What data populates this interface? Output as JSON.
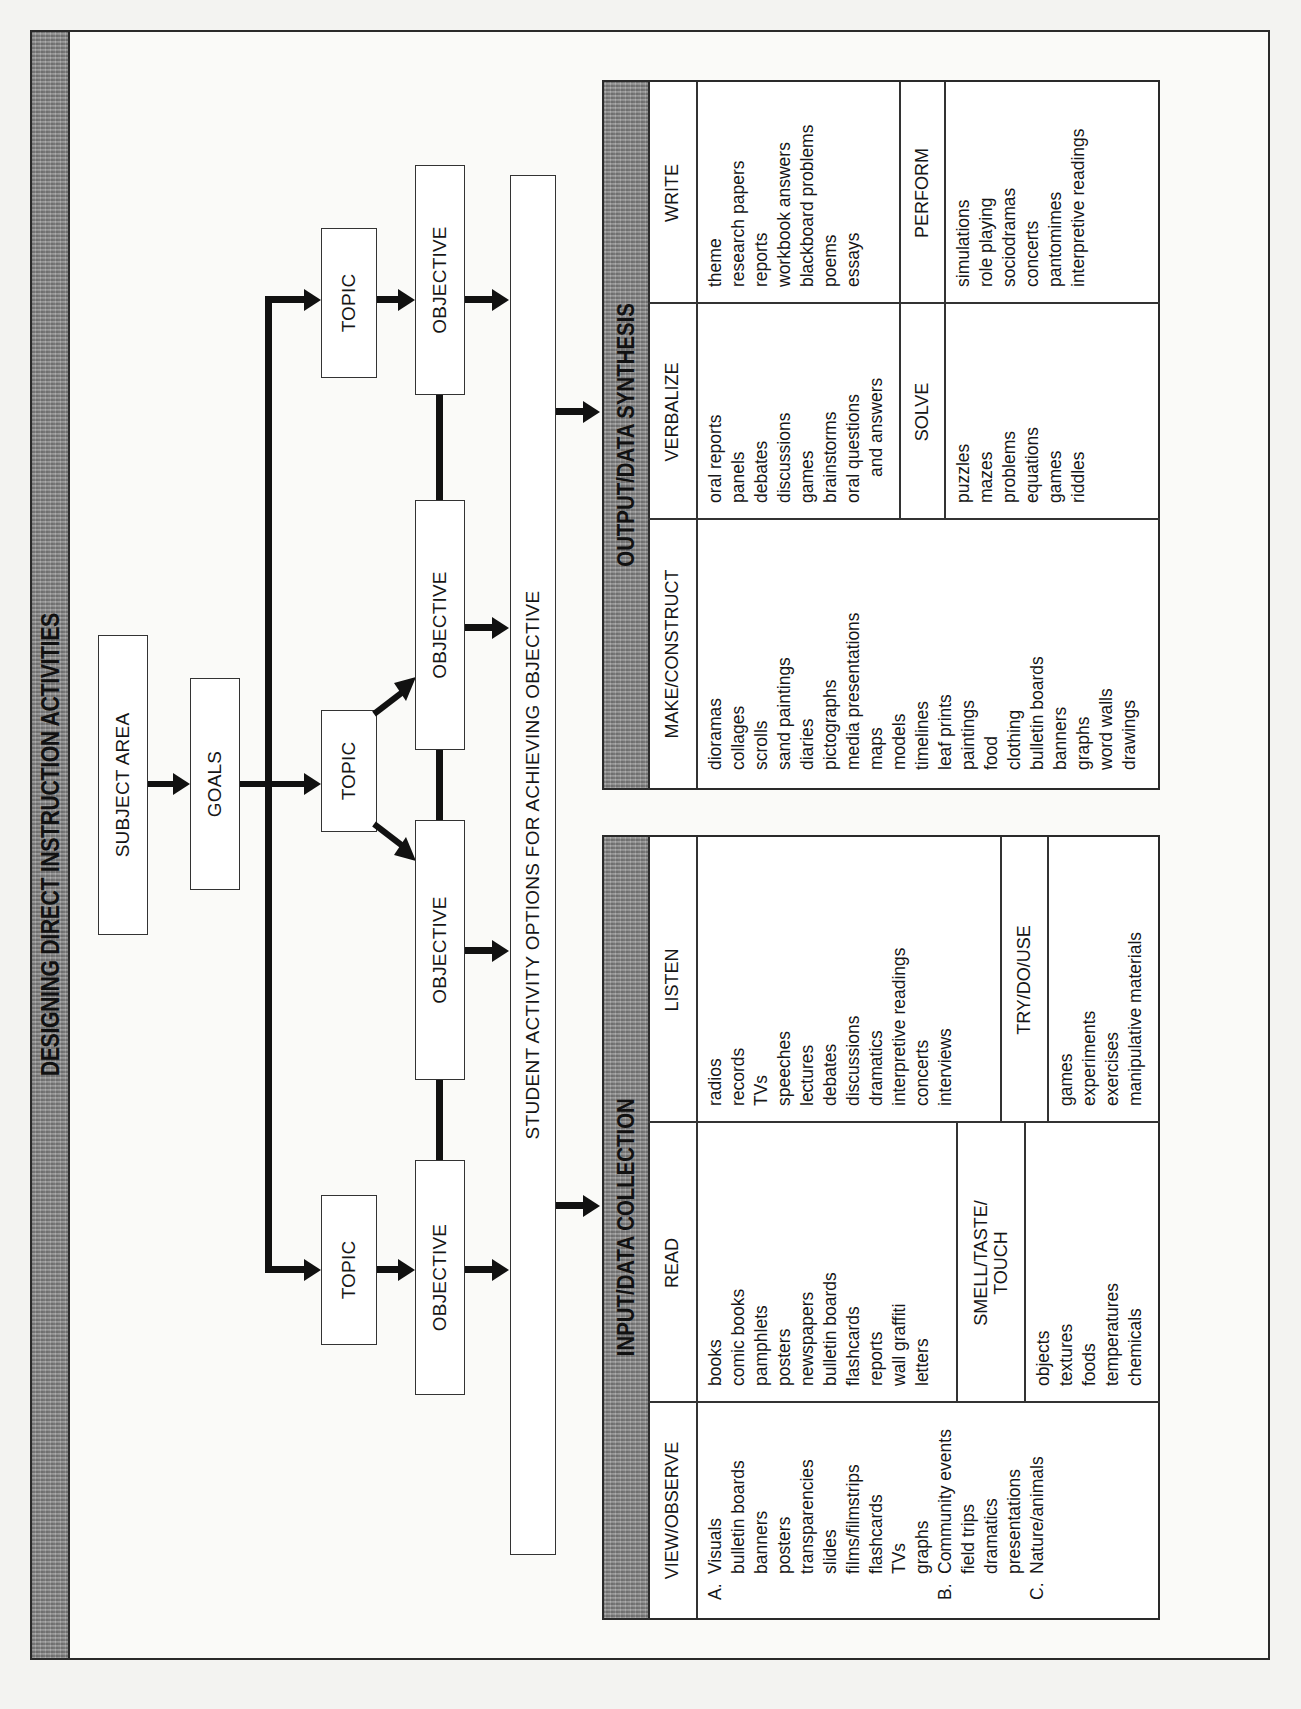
{
  "title": "DESIGNING DIRECT INSTRUCTION ACTIVITIES",
  "flowchart": {
    "subject_area": "SUBJECT AREA",
    "goals": "GOALS",
    "topics": [
      "TOPIC",
      "TOPIC",
      "TOPIC"
    ],
    "objectives": [
      "OBJECTIVE",
      "OBJECTIVE",
      "OBJECTIVE",
      "OBJECTIVE"
    ],
    "activity_bar": "STUDENT ACTIVITY OPTIONS FOR ACHIEVING OBJECTIVE"
  },
  "input_table": {
    "title": "INPUT/DATA COLLECTION",
    "view_observe": {
      "heading": "VIEW/OBSERVE",
      "groups": [
        {
          "marker": "A.",
          "label": "Visuals",
          "items": [
            "bulletin boards",
            "banners",
            "posters",
            "transparencies",
            "slides",
            "films/filmstrips",
            "flashcards",
            "TVs",
            "graphs"
          ]
        },
        {
          "marker": "B.",
          "label": "Community events",
          "items": [
            "field trips",
            "dramatics",
            "presentations"
          ]
        },
        {
          "marker": "C.",
          "label": "Nature/animals",
          "items": []
        }
      ]
    },
    "read": {
      "heading": "READ",
      "items": [
        "books",
        "comic books",
        "pamphlets",
        "posters",
        "newspapers",
        "bulletin boards",
        "flashcards",
        "reports",
        "wall graffiti",
        "letters"
      ]
    },
    "smell_taste_touch": {
      "heading_line1": "SMELL/TASTE/",
      "heading_line2": "TOUCH",
      "items": [
        "objects",
        "textures",
        "foods",
        "temperatures",
        "chemicals"
      ]
    },
    "listen": {
      "heading": "LISTEN",
      "items": [
        "radios",
        "records",
        "TVs",
        "speeches",
        "lectures",
        "debates",
        "discussions",
        "dramatics",
        "interpretive readings",
        "concerts",
        "interviews"
      ]
    },
    "try_do_use": {
      "heading": "TRY/DO/USE",
      "items": [
        "games",
        "experiments",
        "exercises",
        "manipulative materials"
      ]
    }
  },
  "output_table": {
    "title": "OUTPUT/DATA SYNTHESIS",
    "make_construct": {
      "heading": "MAKE/CONSTRUCT",
      "items": [
        "dioramas",
        "collages",
        "scrolls",
        "sand paintings",
        "diaries",
        "pictographs",
        "media presentations",
        "maps",
        "models",
        "timelines",
        "leaf prints",
        "paintings",
        "food",
        "clothing",
        "bulletin boards",
        "banners",
        "graphs",
        "word walls",
        "drawings"
      ]
    },
    "verbalize": {
      "heading": "VERBALIZE",
      "items": [
        "oral reports",
        "panels",
        "debates",
        "discussions",
        "games",
        "brainstorms",
        "oral questions"
      ],
      "continuation": "and answers"
    },
    "solve": {
      "heading": "SOLVE",
      "items": [
        "puzzles",
        "mazes",
        "problems",
        "equations",
        "games",
        "riddles"
      ]
    },
    "write": {
      "heading": "WRITE",
      "items": [
        "theme",
        "research papers",
        "reports",
        "workbook answers",
        "blackboard problems",
        "poems",
        "essays"
      ]
    },
    "perform": {
      "heading": "PERFORM",
      "items": [
        "simulations",
        "role playing",
        "sociodramas",
        "concerts",
        "pantomimes",
        "interpretive readings"
      ]
    }
  }
}
